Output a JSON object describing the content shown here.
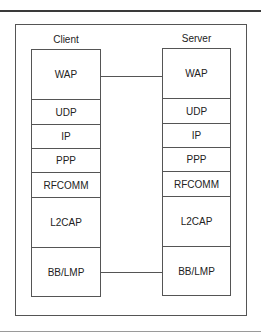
{
  "diagram": {
    "client": {
      "label": "Client",
      "layers": [
        "WAP",
        "UDP",
        "IP",
        "PPP",
        "RFCOMM",
        "L2CAP",
        "BB/LMP"
      ]
    },
    "server": {
      "label": "Server",
      "layers": [
        "WAP",
        "UDP",
        "IP",
        "PPP",
        "RFCOMM",
        "L2CAP",
        "BB/LMP"
      ]
    },
    "connections": [
      {
        "from": "client.WAP",
        "to": "server.WAP"
      },
      {
        "from": "client.BB/LMP",
        "to": "server.BB/LMP"
      }
    ]
  }
}
